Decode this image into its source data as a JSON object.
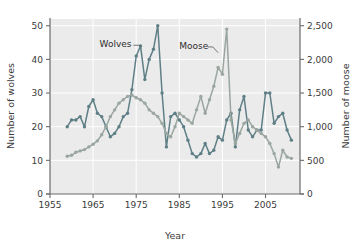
{
  "chart_data": {
    "type": "line",
    "title": "",
    "subtitle": "",
    "xlabel": "Year",
    "ylabel": "Number of wolves",
    "y2label": "Number of moose",
    "xlim": [
      1955,
      2013
    ],
    "ylim": [
      0,
      52
    ],
    "y2lim": [
      0,
      2600
    ],
    "grid": true,
    "legend_position": "inline-annotations",
    "xticks": [
      1955,
      1965,
      1975,
      1985,
      1995,
      2005
    ],
    "xtick_labels": [
      "1955",
      "1965",
      "1975",
      "1985",
      "1995",
      "2005"
    ],
    "yticks": [
      0,
      10,
      20,
      30,
      40,
      50
    ],
    "ytick_labels": [
      "0",
      "10",
      "20",
      "30",
      "40",
      "50"
    ],
    "y2ticks": [
      0,
      500,
      1000,
      1500,
      2000,
      2500
    ],
    "y2tick_labels": [
      "0",
      "500",
      "1,000",
      "1,500",
      "2,000",
      "2,500"
    ],
    "annotations": [
      {
        "text": "Wolves",
        "x": 1966.5,
        "y": 44.5,
        "points_to_x": 1976,
        "points_to_y": 44
      },
      {
        "text": "Moose",
        "x": 1985.0,
        "y": 44.5,
        "points_to_x": 1994,
        "points_to_y": 42
      }
    ],
    "series": [
      {
        "name": "Wolves",
        "axis": "left",
        "color": "#5f7f86",
        "marker": "circle",
        "x": [
          1959,
          1960,
          1961,
          1962,
          1963,
          1964,
          1965,
          1966,
          1967,
          1968,
          1969,
          1970,
          1971,
          1972,
          1973,
          1974,
          1975,
          1976,
          1977,
          1978,
          1979,
          1980,
          1981,
          1982,
          1983,
          1984,
          1985,
          1986,
          1987,
          1988,
          1989,
          1990,
          1991,
          1992,
          1993,
          1994,
          1995,
          1996,
          1997,
          1998,
          1999,
          2000,
          2001,
          2002,
          2003,
          2004,
          2005,
          2006,
          2007,
          2008,
          2009,
          2010,
          2011
        ],
        "values": [
          20,
          22,
          22,
          23,
          20,
          26,
          28,
          24,
          23,
          20,
          17,
          18,
          20,
          23,
          24,
          31,
          41,
          44,
          34,
          40,
          43,
          50,
          30,
          14,
          23,
          24,
          22,
          20,
          16,
          12,
          11,
          12,
          15,
          12,
          13,
          17,
          16,
          22,
          24,
          14,
          25,
          29,
          19,
          17,
          19,
          19,
          30,
          30,
          21,
          23,
          24,
          19,
          16
        ]
      },
      {
        "name": "Moose",
        "axis": "right",
        "color": "#9aa6a0",
        "marker": "circle",
        "x": [
          1959,
          1960,
          1961,
          1962,
          1963,
          1964,
          1965,
          1966,
          1967,
          1968,
          1969,
          1970,
          1971,
          1972,
          1973,
          1974,
          1975,
          1976,
          1977,
          1978,
          1979,
          1980,
          1981,
          1982,
          1983,
          1984,
          1985,
          1986,
          1987,
          1988,
          1989,
          1990,
          1991,
          1992,
          1993,
          1994,
          1995,
          1996,
          1997,
          1998,
          1999,
          2000,
          2001,
          2002,
          2003,
          2004,
          2005,
          2006,
          2007,
          2008,
          2009,
          2010,
          2011
        ],
        "values": [
          560,
          575,
          620,
          640,
          660,
          700,
          740,
          790,
          880,
          1000,
          1150,
          1250,
          1350,
          1400,
          1450,
          1470,
          1430,
          1400,
          1350,
          1250,
          1200,
          1150,
          1050,
          900,
          850,
          1000,
          1200,
          1150,
          1100,
          1050,
          1250,
          1450,
          1200,
          1400,
          1600,
          1880,
          1780,
          2450,
          1100,
          750,
          900,
          1050,
          1100,
          1000,
          950,
          900,
          850,
          750,
          600,
          400,
          650,
          550,
          530
        ]
      }
    ]
  },
  "axis": {
    "x_label": "Year",
    "y_left_label": "Number of wolves",
    "y_right_label": "Number of moose"
  },
  "labels": {
    "wolves": "Wolves",
    "moose": "Moose"
  },
  "colors": {
    "wolves_line": "#5f7f86",
    "moose_line": "#9aa6a0",
    "plot_background": "#ebebeb",
    "gridline": "#ffffff",
    "axis": "#6b6b6b",
    "text": "#3b3b3b"
  }
}
